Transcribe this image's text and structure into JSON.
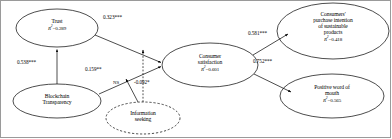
{
  "figure": {
    "type": "sem-path-diagram",
    "title": "",
    "border_color": "#9a9a9a",
    "line_color": "#000000",
    "background": "#ffffff"
  },
  "nodes": [
    {
      "id": "trust",
      "name": "Trust",
      "r2_label": "R",
      "r2_exp": "2",
      "r2_value": "=0.289",
      "r2_text": "R2 =0.289",
      "shape": "ellipse",
      "border": "solid",
      "cx": 57,
      "cy": 28,
      "rx": 41,
      "ry": 19
    },
    {
      "id": "blockchain_transparency",
      "name_line1": "Blockchain",
      "name_line2": "Transparency",
      "r2_text": "",
      "shape": "ellipse",
      "border": "solid",
      "cx": 57,
      "cy": 101,
      "rx": 44,
      "ry": 17
    },
    {
      "id": "consumer_satisfaction",
      "name_line1": "Consumer",
      "name_line2": "satisfaction",
      "r2_label": "R",
      "r2_exp": "2",
      "r2_value": "=0.601",
      "r2_text": "R2 =0.601",
      "shape": "ellipse",
      "border": "solid",
      "cx": 210,
      "cy": 65,
      "rx": 48,
      "ry": 22
    },
    {
      "id": "purchase_intention",
      "name_line1": "Consumers'",
      "name_line2": "purchase intention",
      "name_line3": "of sustainable",
      "name_line4": "products",
      "r2_label": "R",
      "r2_exp": "2",
      "r2_value": "=0.418",
      "r2_text": "R2 =0.418",
      "shape": "ellipse",
      "border": "solid",
      "cx": 333,
      "cy": 31,
      "rx": 56,
      "ry": 28
    },
    {
      "id": "positive_word_of_mouth",
      "name_line1": "Positive word of",
      "name_line2": "mouth",
      "r2_label": "R",
      "r2_exp": "2",
      "r2_value": "=0.565",
      "r2_text": "R2 =0.565",
      "shape": "ellipse",
      "border": "solid",
      "cx": 332,
      "cy": 96,
      "rx": 52,
      "ry": 22
    },
    {
      "id": "information_seeking",
      "name_line1": "Information",
      "name_line2": "seeking",
      "r2_text": "",
      "shape": "ellipse",
      "border": "dashed",
      "cx": 143,
      "cy": 118,
      "rx": 37,
      "ry": 16
    }
  ],
  "paths": [
    {
      "id": "blockchain-to-trust",
      "from": "blockchain_transparency",
      "to": "trust",
      "label": "0.538***",
      "style": "solid",
      "label_x": 17,
      "label_y": 59
    },
    {
      "id": "trust-to-satisfaction",
      "from": "trust",
      "to": "consumer_satisfaction",
      "label": "0.323***",
      "style": "solid",
      "label_x": 103,
      "label_y": 14
    },
    {
      "id": "blockchain-to-satisfaction",
      "from": "blockchain_transparency",
      "to": "consumer_satisfaction",
      "label": "0.159**",
      "style": "solid",
      "label_x": 85,
      "label_y": 66
    },
    {
      "id": "satisfaction-to-purchase-intention",
      "from": "consumer_satisfaction",
      "to": "purchase_intention",
      "label": "0.581***",
      "style": "solid",
      "label_x": 248,
      "label_y": 30
    },
    {
      "id": "satisfaction-to-word-of-mouth",
      "from": "consumer_satisfaction",
      "to": "positive_word_of_mouth",
      "label": "0.752***",
      "style": "solid",
      "label_x": 253,
      "label_y": 58
    },
    {
      "id": "moderator-ns-path",
      "from": "information_seeking",
      "to": "blockchain-to-satisfaction",
      "label": "NS",
      "style": "solid",
      "label_x": 113,
      "label_y": 80
    },
    {
      "id": "moderator-significant-path",
      "from": "information_seeking",
      "to": "trust-to-satisfaction",
      "label": "-0.092*",
      "style": "dashed",
      "label_x": 134,
      "label_y": 79
    }
  ]
}
